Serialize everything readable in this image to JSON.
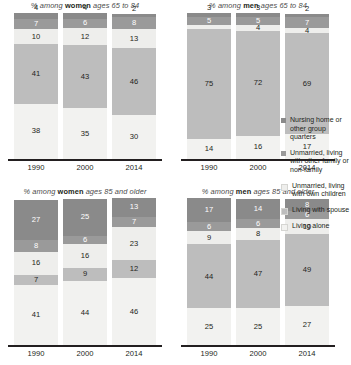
{
  "chart_data": {
    "type": "bar",
    "subtype": "stacked-bar-small-multiples",
    "categories": [
      "1990",
      "2000",
      "2014"
    ],
    "xlabel": "",
    "ylabel": "",
    "ylim": [
      0,
      100
    ],
    "grid": false,
    "legend_position": "right",
    "stack_order_bottom_to_top": [
      "Living alone",
      "Living with spouse",
      "Unmarried, living with own children",
      "Unmarried, living with other family or non-family",
      "Nursing home or other group quarters"
    ],
    "series": [
      {
        "name": "Living alone",
        "color": "#f2f2f0"
      },
      {
        "name": "Living with spouse",
        "color": "#bdbdbd"
      },
      {
        "name": "Unmarried, living with own children",
        "color": "#eeeeec"
      },
      {
        "name": "Unmarried, living with other family or non-family",
        "color": "#9a9a9a"
      },
      {
        "name": "Nursing home or other group quarters",
        "color": "#8a8a8a"
      }
    ],
    "panels": [
      {
        "id": "women-65-84",
        "title_prefix": "% among ",
        "title_bold": "women",
        "title_suffix": " ages 65 to 84",
        "bars": [
          {
            "year": "1990",
            "alone": 38,
            "spouse": 41,
            "own_children": 10,
            "other_family": 7,
            "nursing_home": 4
          },
          {
            "year": "2000",
            "alone": 35,
            "spouse": 43,
            "own_children": 12,
            "other_family": 6,
            "nursing_home": 4
          },
          {
            "year": "2014",
            "alone": 30,
            "spouse": 46,
            "own_children": 13,
            "other_family": 8,
            "nursing_home": 2
          }
        ]
      },
      {
        "id": "men-65-84",
        "title_prefix": "% among ",
        "title_bold": "men",
        "title_suffix": " ages 65 to 84",
        "bars": [
          {
            "year": "1990",
            "alone": 14,
            "spouse": 75,
            "own_children": 3,
            "other_family": 5,
            "nursing_home": 3
          },
          {
            "year": "2000",
            "alone": 16,
            "spouse": 72,
            "own_children": 4,
            "other_family": 5,
            "nursing_home": 3
          },
          {
            "year": "2014",
            "alone": 17,
            "spouse": 69,
            "own_children": 4,
            "other_family": 7,
            "nursing_home": 2
          }
        ]
      },
      {
        "id": "women-85-plus",
        "title_prefix": "% among ",
        "title_bold": "women",
        "title_suffix": " ages 85 and older",
        "bars": [
          {
            "year": "1990",
            "alone": 41,
            "spouse": 7,
            "own_children": 16,
            "other_family": 8,
            "nursing_home": 27
          },
          {
            "year": "2000",
            "alone": 44,
            "spouse": 9,
            "own_children": 16,
            "other_family": 6,
            "nursing_home": 25
          },
          {
            "year": "2014",
            "alone": 46,
            "spouse": 12,
            "own_children": 23,
            "other_family": 7,
            "nursing_home": 13
          }
        ]
      },
      {
        "id": "men-85-plus",
        "title_prefix": "% among ",
        "title_bold": "men",
        "title_suffix": " ages 85 and older",
        "bars": [
          {
            "year": "1990",
            "alone": 25,
            "spouse": 44,
            "own_children": 9,
            "other_family": 6,
            "nursing_home": 17
          },
          {
            "year": "2000",
            "alone": 25,
            "spouse": 47,
            "own_children": 8,
            "other_family": 6,
            "nursing_home": 14
          },
          {
            "year": "2014",
            "alone": 27,
            "spouse": 49,
            "own_children": 10,
            "other_family": 6,
            "nursing_home": 8
          }
        ]
      }
    ]
  },
  "legend": {
    "items": [
      {
        "label": "Nursing home or other group quarters",
        "color": "#8a8a8a"
      },
      {
        "label": "Unmarried, living with other family or non-family",
        "color": "#9a9a9a"
      },
      {
        "label": "Unmarried, living with own children",
        "color": "#eeeeec"
      },
      {
        "label": "Living with spouse",
        "color": "#bdbdbd"
      },
      {
        "label": "Living alone",
        "color": "#f2f2f0"
      }
    ]
  }
}
